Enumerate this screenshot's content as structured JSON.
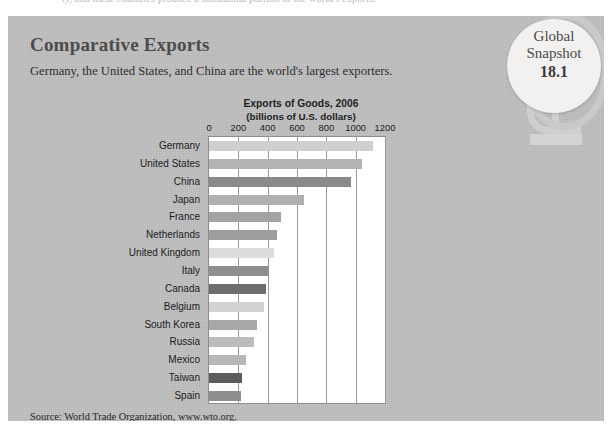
{
  "page_bleed_text": "ty, and these countries produce a substantial portion of the world's exports.",
  "panel": {
    "title": "Comparative Exports",
    "subtitle": "Germany, the United States, and China are the world's largest exporters.",
    "source_prefix": "Source: World Trade Organization, ",
    "source_link": "www.wto.org",
    "source_suffix": "."
  },
  "badge": {
    "line1": "Global",
    "line2": "Snapshot",
    "number": "18.1"
  },
  "colors": {
    "panel_background": "#bfbfbf",
    "plot_background": "#ffffff",
    "gridline": "#9a9a9a",
    "title_text": "#4c4c4c",
    "body_text": "#1b1b1b",
    "badge_face": "#f2f1ef",
    "badge_ring": "#c9c9c9"
  },
  "chart_data": {
    "type": "bar",
    "orientation": "horizontal",
    "title": "Exports of Goods, 2006",
    "subtitle": "(billions of U.S. dollars)",
    "xlabel": "",
    "ylabel": "",
    "xlim": [
      0,
      1200
    ],
    "xticks": [
      0,
      200,
      400,
      600,
      800,
      1000,
      1200
    ],
    "xtick_labels": [
      "0",
      "200",
      "400",
      "600",
      "800",
      "1000",
      "1200"
    ],
    "grid": true,
    "legend": "none",
    "categories": [
      "Germany",
      "United States",
      "China",
      "Japan",
      "France",
      "Netherlands",
      "United Kingdom",
      "Italy",
      "Canada",
      "Belgium",
      "South Korea",
      "Russia",
      "Mexico",
      "Taiwan",
      "Spain"
    ],
    "values": [
      1120,
      1040,
      970,
      650,
      490,
      465,
      445,
      410,
      390,
      375,
      325,
      305,
      250,
      225,
      215
    ],
    "bar_colors": [
      "#cfcfcf",
      "#b3b3b3",
      "#8a8a8a",
      "#b0b0b0",
      "#a3a3a3",
      "#9e9e9e",
      "#dcdcdc",
      "#8f8f8f",
      "#6e6e6e",
      "#d2d2d2",
      "#a8a8a8",
      "#bcbcbc",
      "#b7b7b7",
      "#5c5c5c",
      "#8e8e8e"
    ]
  }
}
